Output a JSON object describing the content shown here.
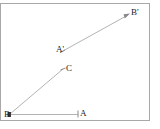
{
  "figure": {
    "type": "geometry-diagram",
    "background_color": "#ffffff",
    "frame": {
      "border_color": "#a8a8a8",
      "x": 0,
      "y": 3,
      "width": 150,
      "height": 118
    },
    "line_color": "#b0b0b0",
    "label_color": "#1a1a1a",
    "points": [
      {
        "id": "B",
        "label": "B",
        "x": 8,
        "y": 116
      },
      {
        "id": "A",
        "label": "A",
        "x": 82,
        "y": 115
      },
      {
        "id": "C",
        "label": "C",
        "x": 67,
        "y": 70
      },
      {
        "id": "Aprime",
        "label": "A'",
        "x": 61,
        "y": 51
      },
      {
        "id": "Bprime",
        "label": "B'",
        "x": 133,
        "y": 13
      }
    ],
    "segments": [
      {
        "id": "ray-BA",
        "from": "B",
        "to": "A",
        "tick_at_end": true,
        "arrow": false
      },
      {
        "id": "ray-BC",
        "from": "B",
        "to": "C",
        "tick_at_end": true,
        "arrow": false
      },
      {
        "id": "seg-ABp",
        "from": "Aprime",
        "to": "Bprime",
        "tick_at_end": false,
        "arrow": true
      }
    ]
  }
}
